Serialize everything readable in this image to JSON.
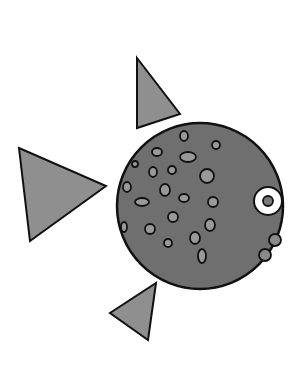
{
  "illustration": {
    "subject": "fish",
    "colors": {
      "background": "#ffffff",
      "body": "#6f6f6f",
      "fin": "#8f8f8f",
      "spot": "#999999",
      "outline": "#111111",
      "eye_ring": "#ffffff",
      "pupil": "#7a7a7a",
      "bubble": "#8a8a8a"
    },
    "body": {
      "cx": 200,
      "cy": 206,
      "r": 83
    },
    "fins": [
      {
        "name": "top-fin",
        "points": "137,58 180,114 137,128"
      },
      {
        "name": "tail-fin",
        "points": "19,148 106,186 30,241"
      },
      {
        "name": "bottom-fin",
        "points": "156,283 148,340 110,313"
      }
    ],
    "eye": {
      "cx": 268,
      "cy": 201,
      "r_outer": 14,
      "r_inner": 5
    },
    "bubbles": [
      {
        "cx": 275,
        "cy": 240,
        "r": 6
      },
      {
        "cx": 265,
        "cy": 255,
        "r": 6
      }
    ],
    "spots": [
      {
        "cx": 184,
        "cy": 136,
        "rx": 4,
        "ry": 5
      },
      {
        "cx": 216,
        "cy": 145,
        "rx": 4,
        "ry": 4
      },
      {
        "cx": 157,
        "cy": 152,
        "rx": 5,
        "ry": 4
      },
      {
        "cx": 188,
        "cy": 157,
        "rx": 8,
        "ry": 5
      },
      {
        "cx": 135,
        "cy": 164,
        "rx": 3,
        "ry": 3
      },
      {
        "cx": 153,
        "cy": 172,
        "rx": 4,
        "ry": 5
      },
      {
        "cx": 172,
        "cy": 170,
        "rx": 4,
        "ry": 4
      },
      {
        "cx": 207,
        "cy": 176,
        "rx": 7,
        "ry": 7
      },
      {
        "cx": 127,
        "cy": 187,
        "rx": 4,
        "ry": 5
      },
      {
        "cx": 165,
        "cy": 190,
        "rx": 5,
        "ry": 6
      },
      {
        "cx": 142,
        "cy": 202,
        "rx": 7,
        "ry": 4
      },
      {
        "cx": 184,
        "cy": 198,
        "rx": 5,
        "ry": 4
      },
      {
        "cx": 213,
        "cy": 202,
        "rx": 5,
        "ry": 5
      },
      {
        "cx": 173,
        "cy": 217,
        "rx": 5,
        "ry": 5
      },
      {
        "cx": 124,
        "cy": 227,
        "rx": 3,
        "ry": 5
      },
      {
        "cx": 150,
        "cy": 229,
        "rx": 5,
        "ry": 5
      },
      {
        "cx": 210,
        "cy": 225,
        "rx": 5,
        "ry": 6
      },
      {
        "cx": 195,
        "cy": 238,
        "rx": 5,
        "ry": 6
      },
      {
        "cx": 168,
        "cy": 243,
        "rx": 4,
        "ry": 4
      },
      {
        "cx": 202,
        "cy": 256,
        "rx": 4,
        "ry": 7
      }
    ]
  }
}
